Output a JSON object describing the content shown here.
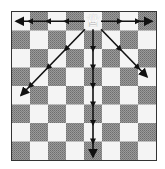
{
  "diagram": {
    "board": {
      "files": 8,
      "ranks": 8,
      "light_color": "#f4f4f4",
      "dark_color": "#8a8a8a",
      "top_left": "light"
    },
    "piece": {
      "name": "queen",
      "color": "white",
      "glyph": "♕",
      "col": 4,
      "row": 0
    },
    "arrows": [
      {
        "direction": "west",
        "to_col": 0,
        "to_row": 0
      },
      {
        "direction": "east",
        "to_col": 7,
        "to_row": 0
      },
      {
        "direction": "south",
        "to_col": 4,
        "to_row": 7
      },
      {
        "direction": "south-west",
        "to_col": 0,
        "to_row": 4
      },
      {
        "direction": "south-east",
        "to_col": 7,
        "to_row": 3
      }
    ]
  }
}
